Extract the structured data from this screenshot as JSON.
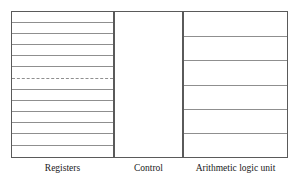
{
  "diagram": {
    "background_color": "#ffffff",
    "border_color": "#5a5a5a",
    "divider_color": "#8f8f8f",
    "blocks": [
      {
        "id": "registers",
        "label": "Registers",
        "x": 11,
        "y": 11,
        "width": 103,
        "height": 147,
        "row_count": 13,
        "dividers": [
          {
            "y": 22,
            "style": "solid"
          },
          {
            "y": 33,
            "style": "solid"
          },
          {
            "y": 44,
            "style": "solid"
          },
          {
            "y": 55,
            "style": "solid"
          },
          {
            "y": 66,
            "style": "solid"
          },
          {
            "y": 78,
            "style": "dashed"
          },
          {
            "y": 89,
            "style": "solid"
          },
          {
            "y": 100,
            "style": "solid"
          },
          {
            "y": 111,
            "style": "solid"
          },
          {
            "y": 122,
            "style": "solid"
          },
          {
            "y": 133,
            "style": "solid"
          },
          {
            "y": 145,
            "style": "solid"
          }
        ]
      },
      {
        "id": "control",
        "label": "Control",
        "x": 114,
        "y": 11,
        "width": 69,
        "height": 147,
        "row_count": 1,
        "dividers": []
      },
      {
        "id": "alu",
        "label": "Arithmetic logic unit",
        "x": 183,
        "y": 11,
        "width": 105,
        "height": 147,
        "row_count": 6,
        "dividers": [
          {
            "y": 36,
            "style": "solid"
          },
          {
            "y": 60,
            "style": "solid"
          },
          {
            "y": 85,
            "style": "solid"
          },
          {
            "y": 109,
            "style": "solid"
          },
          {
            "y": 133,
            "style": "solid"
          }
        ]
      }
    ]
  }
}
